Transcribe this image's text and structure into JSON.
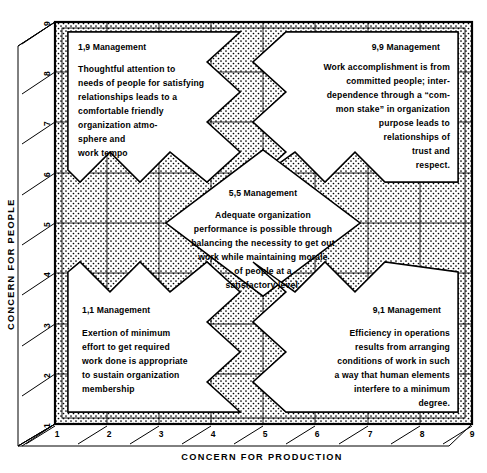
{
  "diagram": {
    "name": "managerial-grid",
    "axes": {
      "x": {
        "title": "CONCERN FOR PRODUCTION",
        "ticks": [
          "1",
          "2",
          "3",
          "4",
          "5",
          "6",
          "7",
          "8",
          "9"
        ],
        "min": 1,
        "max": 9
      },
      "y": {
        "title": "CONCERN FOR PEOPLE",
        "ticks": [
          "1",
          "2",
          "3",
          "4",
          "5",
          "6",
          "7",
          "8",
          "9"
        ],
        "min": 1,
        "max": 9
      }
    },
    "colors": {
      "line": "#000000",
      "fill_white": "#ffffff",
      "stipple": "#000000",
      "background": "#ffffff"
    },
    "cells": [
      {
        "id": "1-9",
        "title": "1,9 Management",
        "coord": [
          1,
          9
        ],
        "align": "left",
        "lines": [
          "Thoughtful attention to",
          "needs of people for satisfying",
          "relationships leads to a",
          "comfortable friendly",
          "organization atmo-",
          "sphere and",
          "work tempo"
        ]
      },
      {
        "id": "9-9",
        "title": "9,9 Management",
        "coord": [
          9,
          9
        ],
        "align": "right",
        "lines": [
          "Work accomplishment is from",
          "committed people; inter-",
          "dependence through a “com-",
          "mon stake” in organization",
          "purpose leads to",
          "relationships of",
          "trust and",
          "respect."
        ]
      },
      {
        "id": "5-5",
        "title": "5,5 Management",
        "coord": [
          5,
          5
        ],
        "align": "center",
        "lines": [
          "Adequate organization",
          "performance is possible through",
          "balancing the necessity to get out",
          "work while maintaining morale",
          "of people at a",
          "satisfactory level."
        ]
      },
      {
        "id": "1-1",
        "title": "1,1 Management",
        "coord": [
          1,
          1
        ],
        "align": "left",
        "lines": [
          "Exertion of minimum",
          "effort to get required",
          "work done is appropriate",
          "to sustain organization",
          "membership"
        ]
      },
      {
        "id": "9-1",
        "title": "9,1 Management",
        "coord": [
          9,
          1
        ],
        "align": "right",
        "lines": [
          "Efficiency in operations",
          "results from arranging",
          "conditions of work in such",
          "a way that human elements",
          "interfere to a minimum",
          "degree."
        ]
      }
    ]
  }
}
